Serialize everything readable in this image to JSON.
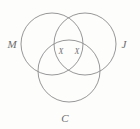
{
  "diagram": {
    "type": "venn-3-circle",
    "title": "",
    "background_color": "#fdfdfc",
    "stroke_color": "#8b8b8b",
    "label_color": "#6b6b6b",
    "width": 140,
    "height": 129,
    "sets": [
      {
        "id": "M",
        "label": "M",
        "cx": 52,
        "cy": 44,
        "r": 31,
        "label_x": 12,
        "label_y": 48
      },
      {
        "id": "J",
        "label": "J",
        "cx": 85,
        "cy": 44,
        "r": 31,
        "label_x": 124,
        "label_y": 48
      },
      {
        "id": "C",
        "label": "C",
        "cx": 69,
        "cy": 71,
        "r": 31,
        "label_x": 65,
        "label_y": 122
      }
    ],
    "region_marks": [
      {
        "id": "mark-left",
        "label": "X",
        "x": 61,
        "y": 54,
        "region": "M-and-C"
      },
      {
        "id": "mark-right",
        "label": "X",
        "x": 77,
        "y": 54,
        "region": "J-and-C"
      }
    ]
  }
}
